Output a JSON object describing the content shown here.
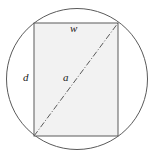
{
  "figure": {
    "background_color": "#ffffff",
    "stroke_color": "#5a5a5a",
    "rect_fill_color": "#f2f2f2",
    "label_color": "#1a1a1a"
  },
  "labels": {
    "width": "w",
    "height": "d",
    "diagonal": "a"
  },
  "chart_data": {
    "type": "diagram",
    "shapes": [
      {
        "name": "circle",
        "type": "circle",
        "cx": 77,
        "cy": 79,
        "r": 70.5,
        "fill": "none",
        "stroke": "#5a5a5a",
        "stroke_width": 1
      },
      {
        "name": "rectangle",
        "type": "rect",
        "x": 34,
        "y": 23,
        "width": 84,
        "height": 113,
        "fill": "#f2f2f2",
        "stroke": "#5a5a5a",
        "stroke_width": 1
      },
      {
        "name": "diagonal",
        "type": "line",
        "x1": 34,
        "y1": 136,
        "x2": 118,
        "y2": 23,
        "stroke": "#5a5a5a",
        "stroke_width": 1,
        "dash": "dash-dot"
      }
    ],
    "annotations": [
      {
        "name": "width-label",
        "text": "w",
        "x": 75,
        "y": 29,
        "style": "italic"
      },
      {
        "name": "height-label",
        "text": "d",
        "x": 28,
        "y": 78,
        "style": "italic"
      },
      {
        "name": "diagonal-label",
        "text": "a",
        "x": 68,
        "y": 78,
        "style": "italic"
      }
    ],
    "xlabel": "",
    "ylabel": "",
    "legend": []
  }
}
